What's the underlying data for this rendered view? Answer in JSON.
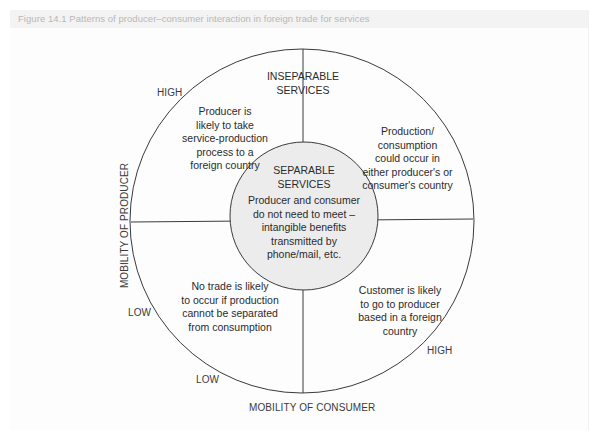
{
  "caption": "Figure 14.1  Patterns of producer–consumer interaction in foreign trade for services",
  "colors": {
    "line": "#3a3a3a",
    "inner_circle_fill": "#ececec",
    "caption_text": "#b8b8b8",
    "caption_band": "#f3f3f3"
  },
  "diagram": {
    "top_label": "INSEPARABLE\nSERVICES",
    "center": {
      "title": "SEPARABLE\nSERVICES",
      "text": "Producer and consumer\ndo not need to meet –\nintangible benefits\ntransmitted by\nphone/mail, etc."
    },
    "quadrants": {
      "top_left": "Producer is\nlikely to take\nservice-production\nprocess to a\nforeign country",
      "top_right": "Production/\nconsumption\ncould occur in\neither producer's or\nconsumer's country",
      "bottom_left": "No trade is likely\nto occur if production\ncannot be separated\nfrom consumption",
      "bottom_right": "Customer is likely\nto go to producer\nbased in a foreign\ncountry"
    },
    "axes": {
      "y_axis_label": "MOBILITY OF PRODUCER",
      "x_axis_label": "MOBILITY OF CONSUMER",
      "y_high": "HIGH",
      "y_low": "LOW",
      "x_low": "LOW",
      "x_high": "HIGH"
    }
  }
}
